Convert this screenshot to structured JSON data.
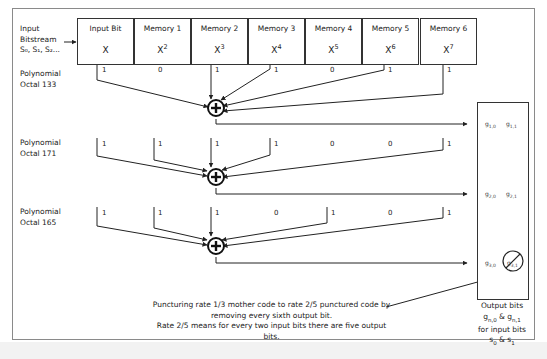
{
  "input": {
    "line1": "Input",
    "line2": "Bitstream",
    "line3": "S₀, S₁, S₂..."
  },
  "registers": [
    {
      "name": "Input Bit",
      "base": "X",
      "exp": ""
    },
    {
      "name": "Memory 1",
      "base": "X",
      "exp": "2"
    },
    {
      "name": "Memory 2",
      "base": "X",
      "exp": "3"
    },
    {
      "name": "Memory 3",
      "base": "X",
      "exp": "4"
    },
    {
      "name": "Memory 4",
      "base": "X",
      "exp": "5"
    },
    {
      "name": "Memory 5",
      "base": "X",
      "exp": "6"
    },
    {
      "name": "Memory 6",
      "base": "X",
      "exp": "7"
    }
  ],
  "polynomials": [
    {
      "line1": "Polynomial",
      "line2": "Octal 133",
      "taps": [
        "1",
        "0",
        "1",
        "1",
        "0",
        "1",
        "1"
      ]
    },
    {
      "line1": "Polynomial",
      "line2": "Octal 171",
      "taps": [
        "1",
        "1",
        "1",
        "1",
        "0",
        "0",
        "1"
      ]
    },
    {
      "line1": "Polynomial",
      "line2": "Octal 165",
      "taps": [
        "1",
        "1",
        "1",
        "0",
        "1",
        "0",
        "1"
      ]
    }
  ],
  "adder_symbol": "+",
  "outputs": {
    "g10": "g1,0",
    "g11": "g1,1",
    "g20": "g2,0",
    "g21": "g2,1",
    "g30": "g3,0",
    "g31": "g3,1 (punctured)"
  },
  "output_caption": {
    "line1": "Output bits",
    "line2": "gn,0 & gn,1",
    "line3": "for input bits",
    "line4": "s0 & s1"
  },
  "caption": {
    "line1": "Puncturing rate 1/3 mother code to rate 2/5 punctured code by",
    "line2": "removing every sixth output bit.",
    "line3": "Rate 2/5 means for every two input bits there are five output bits."
  }
}
